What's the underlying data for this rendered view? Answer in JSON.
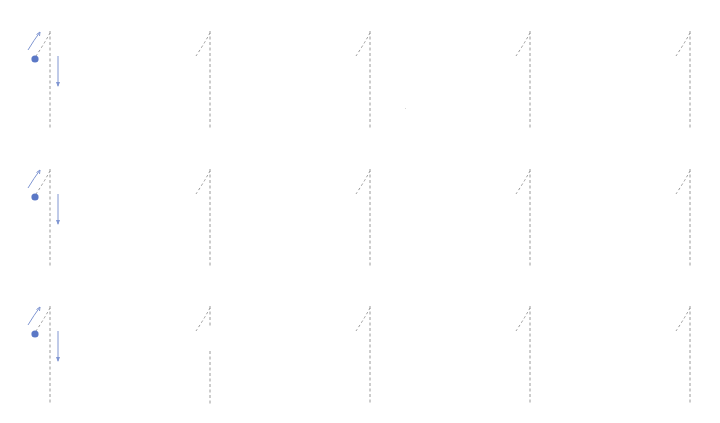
{
  "worksheet": {
    "glyph": "1",
    "colors": {
      "trace_stroke": "#9a9a9a",
      "guide_blue": "#5b78c6",
      "guide_arrow": "#8096d2",
      "background": "#ffffff"
    },
    "rows": [
      {
        "top": 30,
        "cells": [
          {
            "x": 50,
            "guide": true,
            "stem_gap": false
          },
          {
            "x": 210,
            "guide": false,
            "stem_gap": false
          },
          {
            "x": 370,
            "guide": false,
            "stem_gap": false
          },
          {
            "x": 530,
            "guide": false,
            "stem_gap": false
          },
          {
            "x": 690,
            "guide": false,
            "stem_gap": false
          }
        ]
      },
      {
        "top": 168,
        "cells": [
          {
            "x": 50,
            "guide": true,
            "stem_gap": false
          },
          {
            "x": 210,
            "guide": false,
            "stem_gap": false
          },
          {
            "x": 370,
            "guide": false,
            "stem_gap": false
          },
          {
            "x": 530,
            "guide": false,
            "stem_gap": false
          },
          {
            "x": 690,
            "guide": false,
            "stem_gap": false
          }
        ]
      },
      {
        "top": 305,
        "cells": [
          {
            "x": 50,
            "guide": true,
            "stem_gap": false
          },
          {
            "x": 210,
            "guide": false,
            "stem_gap": true
          },
          {
            "x": 370,
            "guide": false,
            "stem_gap": false
          },
          {
            "x": 530,
            "guide": false,
            "stem_gap": false
          },
          {
            "x": 690,
            "guide": false,
            "stem_gap": false
          }
        ]
      }
    ]
  }
}
